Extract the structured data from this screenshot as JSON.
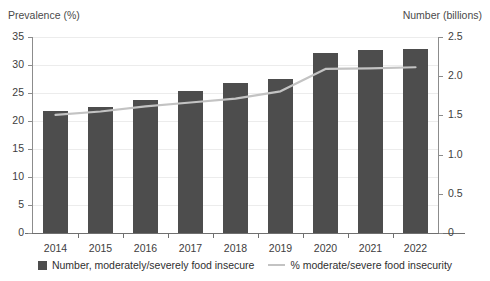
{
  "left_axis": {
    "title": "Prevalence (%)",
    "ticks": [
      "35",
      "30",
      "25",
      "20",
      "15",
      "10",
      "5",
      "0"
    ]
  },
  "right_axis": {
    "title": "Number (billions)",
    "ticks": [
      "2.5",
      "2.0",
      "1.5",
      "1.0",
      "0.5",
      "0"
    ]
  },
  "legend": {
    "bar_label": "Number, moderately/severely food insecure",
    "line_label": "% moderate/severe food insecurity"
  },
  "colors": {
    "bar": "#4d4d4d",
    "line": "#c3c3c3",
    "grid": "#ececec",
    "axis": "#6f6f6f",
    "text": "#3d3d3d"
  },
  "chart_data": {
    "type": "bar",
    "title": "",
    "xlabel": "",
    "ylabel": "Prevalence (%)",
    "y2label": "Number (billions)",
    "categories": [
      "2014",
      "2015",
      "2016",
      "2017",
      "2018",
      "2019",
      "2020",
      "2021",
      "2022"
    ],
    "ylim": [
      0,
      35
    ],
    "y2lim": [
      0,
      2.5
    ],
    "ytick_step": 5,
    "y2tick_step": 0.5,
    "grid": true,
    "legend_position": "bottom",
    "series": [
      {
        "name": "Number, moderately/severely food insecure",
        "type": "bar",
        "axis": "right",
        "unit": "billions",
        "values": [
          1.56,
          1.61,
          1.7,
          1.81,
          1.91,
          1.96,
          2.3,
          2.33,
          2.35
        ]
      },
      {
        "name": "% moderate/severe food insecurity",
        "type": "line",
        "axis": "left",
        "unit": "percent",
        "values": [
          21.1,
          21.7,
          22.6,
          23.3,
          24.0,
          25.3,
          29.3,
          29.4,
          29.6
        ]
      }
    ]
  }
}
